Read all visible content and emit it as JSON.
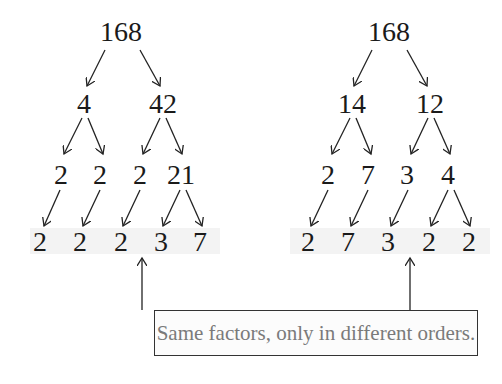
{
  "trees": [
    {
      "root": "168",
      "level1": [
        "4",
        "42"
      ],
      "level2": [
        "2",
        "2",
        "2",
        "21"
      ],
      "level3": [
        "2",
        "2",
        "2",
        "3",
        "7"
      ]
    },
    {
      "root": "168",
      "level1": [
        "14",
        "12"
      ],
      "level2": [
        "2",
        "7",
        "3",
        "4"
      ],
      "level3": [
        "2",
        "7",
        "3",
        "2",
        "2"
      ]
    }
  ],
  "caption": "Same factors, only in different orders.",
  "colors": {
    "text": "#1a1a1a",
    "caption_text": "#7a7a7a",
    "band": "#f3f3f3",
    "border": "#333333"
  }
}
